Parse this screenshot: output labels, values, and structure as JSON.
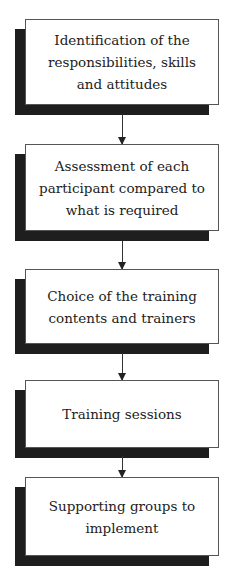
{
  "diagram": {
    "type": "flowchart",
    "direction": "top-to-bottom",
    "steps": [
      {
        "label": "Identification of the responsibilities, skills and attitudes"
      },
      {
        "label": "Assessment of each participant compared to what is required"
      },
      {
        "label": "Choice of the training contents and trainers"
      },
      {
        "label": "Training sessions"
      },
      {
        "label": "Supporting groups to implement"
      }
    ],
    "edges": [
      {
        "from": 0,
        "to": 1
      },
      {
        "from": 1,
        "to": 2
      },
      {
        "from": 2,
        "to": 3
      },
      {
        "from": 3,
        "to": 4
      }
    ],
    "colors": {
      "box_fill": "#ffffff",
      "box_border": "#555555",
      "shadow": "#1e1e1e",
      "arrow": "#333333",
      "text": "#222222"
    }
  }
}
